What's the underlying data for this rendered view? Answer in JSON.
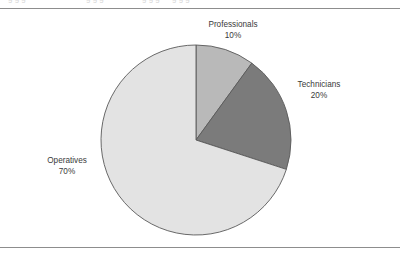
{
  "figure": {
    "background_color": "#ffffff",
    "rule_color": "#8d8d8d",
    "label_color": "#3a3a3a",
    "clipped_text_top": "g g g"
  },
  "chart_data": {
    "type": "pie",
    "title": "",
    "subtitle": "",
    "xlabel": "",
    "ylabel": "",
    "legend_position": "none",
    "grid": false,
    "start_angle_deg": 0,
    "direction": "clockwise",
    "center": {
      "x": 196,
      "y": 140
    },
    "radius": 95,
    "categories": [
      "Professionals",
      "Technicians",
      "Operatives"
    ],
    "values": [
      10,
      20,
      70
    ],
    "unit": "%",
    "slices": [
      {
        "label": "Professionals",
        "value": 10,
        "value_text": "10%",
        "color": "#b9b9b9",
        "start_deg": 0,
        "end_deg": 36
      },
      {
        "label": "Technicians",
        "value": 20,
        "value_text": "20%",
        "color": "#7b7b7b",
        "start_deg": 36,
        "end_deg": 108
      },
      {
        "label": "Operatives",
        "value": 70,
        "value_text": "70%",
        "color": "#e3e3e3",
        "start_deg": 108,
        "end_deg": 360
      }
    ],
    "slice_outline_color": "#595959"
  }
}
